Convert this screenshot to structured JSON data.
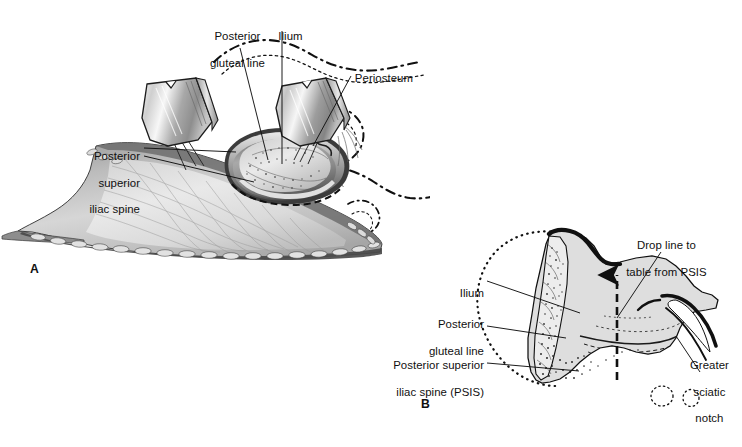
{
  "figure": {
    "kind": "medical-illustration",
    "background_color": "#ffffff",
    "ink_color": "#101010",
    "bone_fill_color": "#dedede",
    "metal_fill_color": "#b4b4b4",
    "tissue_fill_color": "#c8c8c8"
  },
  "panels": [
    {
      "id": "A",
      "panel_label": "A",
      "caption_position": "lower-left",
      "description": "Operative view: two retractors hold the wound open, exposing the outer table of the ilium with periosteum reflected.",
      "labels": [
        {
          "name": "posterior-gluteal-line",
          "text": "Posterior\ngluteal line",
          "align": "center"
        },
        {
          "name": "ilium",
          "text": "Ilium",
          "align": "center"
        },
        {
          "name": "periosteum",
          "text": "Periosteum",
          "align": "left"
        },
        {
          "name": "posterior-superior-iliac-spine",
          "text": "Posterior\nsuperior\niliac spine",
          "align": "right"
        }
      ]
    },
    {
      "id": "B",
      "panel_label": "B",
      "caption_position": "lower-left",
      "description": "Sagittal/oblique bone diagram of the posterior ilium showing the vertical drop line from the PSIS to the table and the greater sciatic notch.",
      "labels": [
        {
          "name": "drop-line-to-table-from-psis",
          "text": "Drop line to\ntable from PSIS",
          "align": "center"
        },
        {
          "name": "ilium",
          "text": "Ilium",
          "align": "right"
        },
        {
          "name": "posterior-gluteal-line",
          "text": "Posterior\ngluteal line",
          "align": "right"
        },
        {
          "name": "posterior-superior-iliac-spine-psis",
          "text": "Posterior superior\niliac spine (PSIS)",
          "align": "right"
        },
        {
          "name": "greater-sciatic-notch",
          "text": "Greater\nsciatic\nnotch",
          "align": "center"
        }
      ]
    }
  ],
  "labels_flat": {
    "a_posterior_gluteal_line_l1": "Posterior",
    "a_posterior_gluteal_line_l2": "gluteal line",
    "a_ilium": "Ilium",
    "a_periosteum": "Periosteum",
    "a_psis_l1": "Posterior",
    "a_psis_l2": "superior",
    "a_psis_l3": "iliac spine",
    "a_panel": "A",
    "b_dropline_l1": "Drop line to",
    "b_dropline_l2": "table from PSIS",
    "b_ilium": "Ilium",
    "b_posterior_gluteal_line_l1": "Posterior",
    "b_posterior_gluteal_line_l2": "gluteal line",
    "b_psis_l1": "Posterior superior",
    "b_psis_l2": "iliac spine (PSIS)",
    "b_notch_l1": "Greater",
    "b_notch_l2": "sciatic",
    "b_notch_l3": "notch",
    "b_panel": "B"
  },
  "line_styles": {
    "leader": "solid thin black",
    "periosteum_outline": "dash-dot black",
    "bone_ghost_outline": "dotted black",
    "drop_line": "dashed black with upward arrowhead"
  }
}
